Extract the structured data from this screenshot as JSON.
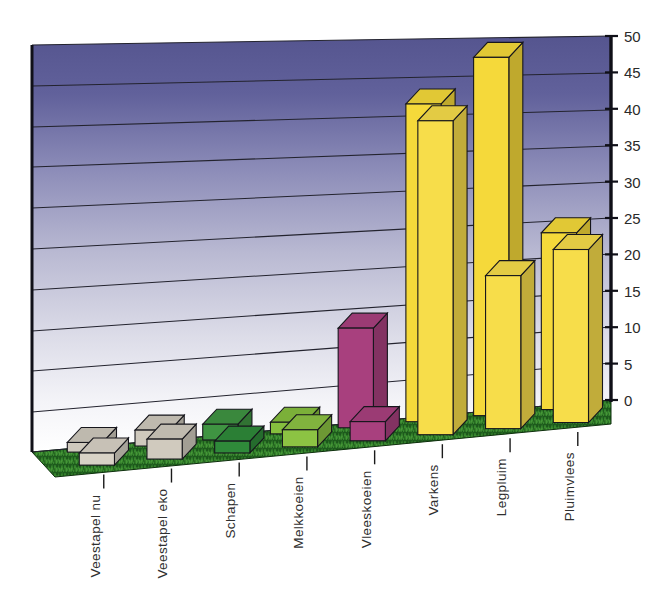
{
  "chart_data": {
    "type": "bar",
    "title": "",
    "subtitle": "",
    "xlabel": "",
    "ylabel": "",
    "ylim": [
      0,
      50
    ],
    "ytick_step": 5,
    "yticks": [
      "0",
      "5",
      "10",
      "15",
      "20",
      "25",
      "30",
      "35",
      "40",
      "45",
      "50"
    ],
    "grid": true,
    "legend": "none",
    "projection": "3d",
    "categories": [
      "Veestapel nu",
      "Veestapel eko",
      "Schapen",
      "Melkkoeien",
      "Vleeskoeien",
      "Varkens",
      "Legpluim",
      "Pluimvlees"
    ],
    "series": [
      {
        "name": "back-row",
        "values": [
          1.2,
          2.0,
          2.0,
          1.5,
          13.0,
          42.0,
          48.0,
          24.0
        ]
      },
      {
        "name": "front-row",
        "values": [
          1.5,
          2.5,
          1.5,
          2.2,
          2.5,
          41.5,
          20.5,
          23.5
        ]
      }
    ],
    "bar_colors": [
      "#cfc9bd",
      "#cfc9bd",
      "#3f9442",
      "#86bf3e",
      "#a8407e",
      "#f5d93a",
      "#f5d93a",
      "#f5d93a"
    ],
    "bar_colors_front": [
      "#d8d2c6",
      "#d0cabe",
      "#2f8a3a",
      "#8cc343",
      "#a8407e",
      "#f7dd4a",
      "#f7dd4a",
      "#f7dd4a"
    ],
    "palette": {
      "wall_top": "#5c5c96",
      "wall_bottom": "#ffffff",
      "floor_grass_dark": "#1e5c1e",
      "floor_grass_light": "#3f8a34",
      "axis_line": "#101018",
      "gridline": "#20202c",
      "tick_text": "#2a2a2a",
      "beige": "#cfc9bd",
      "green_dark": "#3f9442",
      "green_light": "#86bf3e",
      "magenta": "#a8407e",
      "yellow": "#f5d93a"
    }
  }
}
